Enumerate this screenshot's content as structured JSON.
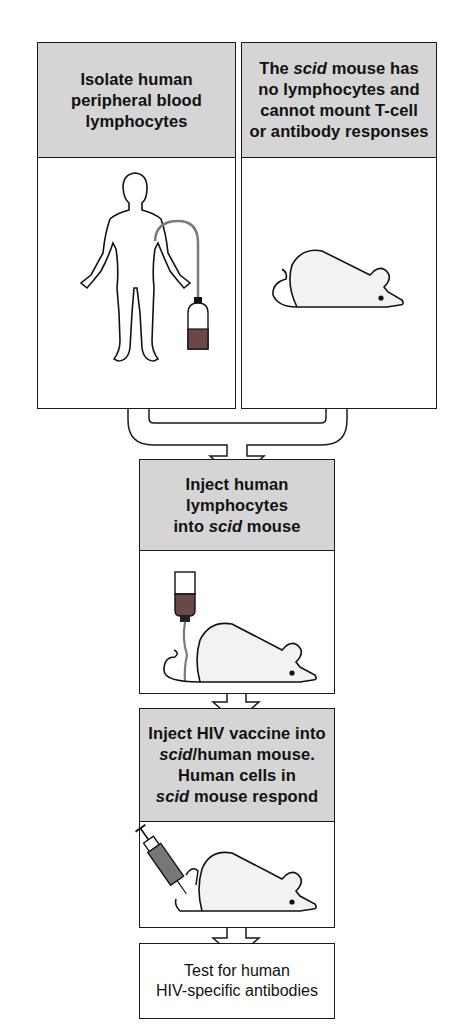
{
  "steps": [
    {
      "id": "isolate",
      "line1": "Isolate human",
      "line2": "peripheral blood",
      "line3": "lymphocytes",
      "illustration": "human-figure-with-blood-collection-bottle"
    },
    {
      "id": "scid-mouse",
      "line1_pre": "The ",
      "line1_italic": "scid",
      "line1_post": " mouse has",
      "line2": "no lymphocytes and",
      "line3": "cannot mount T-cell",
      "line4": "or antibody responses",
      "illustration": "white-mouse"
    },
    {
      "id": "inject-lymphocytes",
      "line1": "Inject human",
      "line2": "lymphocytes",
      "line3_pre": "into ",
      "line3_italic": "scid",
      "line3_post": " mouse",
      "illustration": "mouse-with-iv-drip-bag"
    },
    {
      "id": "inject-vaccine",
      "line1": "Inject HIV vaccine into",
      "line2_italic": "scid",
      "line2_post": "/human mouse.",
      "line3": "Human cells in",
      "line4_italic": "scid",
      "line4_post": " mouse respond",
      "illustration": "mouse-with-syringe"
    },
    {
      "id": "test",
      "line1": "Test for human",
      "line2": "HIV-specific antibodies"
    }
  ],
  "colors": {
    "header_fill": "#d5d5d5",
    "outline": "#1a1a1a",
    "blood": "#6b4848",
    "mouse_fill": "#f2f2f2",
    "tube": "#7a7a7a"
  }
}
